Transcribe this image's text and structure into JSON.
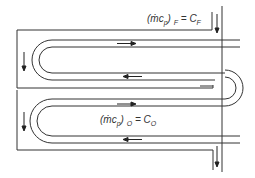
{
  "diagram": {
    "type": "counterflow serpentine heat exchanger schematic",
    "labels": {
      "fluid_f": {
        "lhs": "(ṁc",
        "lhs_sub": "p",
        "close": ")",
        "side_sub": "F",
        "eq": "= C",
        "rhs_sub": "F"
      },
      "fluid_o": {
        "lhs": "(ṁc",
        "lhs_sub": "p",
        "close": ")",
        "side_sub": "O",
        "eq": "= C",
        "rhs_sub": "O"
      }
    },
    "colors": {
      "line": "#333333",
      "background": "#ffffff"
    },
    "flow_arrows": [
      {
        "location": "upper-tube-top",
        "direction": "right"
      },
      {
        "location": "upper-tube-bottom",
        "direction": "left"
      },
      {
        "location": "lower-tube-top",
        "direction": "right"
      },
      {
        "location": "lower-tube-bottom",
        "direction": "left"
      },
      {
        "location": "upper-shell-left",
        "direction": "down"
      },
      {
        "location": "lower-shell-left",
        "direction": "down"
      },
      {
        "location": "fluid-f-inlet",
        "direction": "down"
      },
      {
        "location": "fluid-f-outlet",
        "direction": "down"
      }
    ]
  }
}
